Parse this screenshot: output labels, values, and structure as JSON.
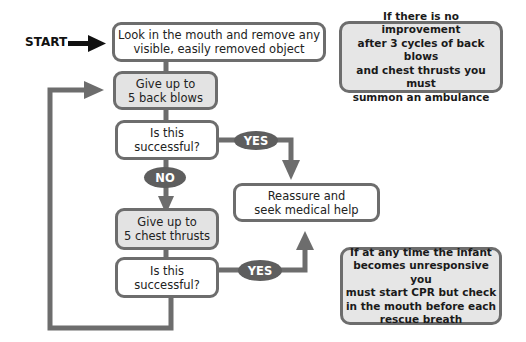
{
  "start_label": "START",
  "nodes": {
    "look_mouth": "Look in the mouth and remove any\nvisible, easily removed object",
    "back_blows": "Give up to\n5 back blows",
    "successful_1": "Is this\nsuccessful?",
    "chest_thrusts": "Give up to\n5 chest thrusts",
    "successful_2": "Is this\nsuccessful?",
    "reassure": "Reassure and\nseek medical help"
  },
  "labels": {
    "yes_1": "YES",
    "no": "NO",
    "yes_2": "YES"
  },
  "notes": {
    "ambulance": "If there is no improvement\nafter 3 cycles of back blows\nand chest thrusts you must\nsummon an ambulance",
    "cpr": "If at any time the infant\nbecomes unresponsive you\nmust start CPR but check\nin the mouth before each\nrescue breath"
  },
  "colors": {
    "line": "#6d6d6d",
    "pill": "#5e5e5e",
    "grey_box": "#e3e3e3",
    "note_bg": "#e6e6e6"
  }
}
